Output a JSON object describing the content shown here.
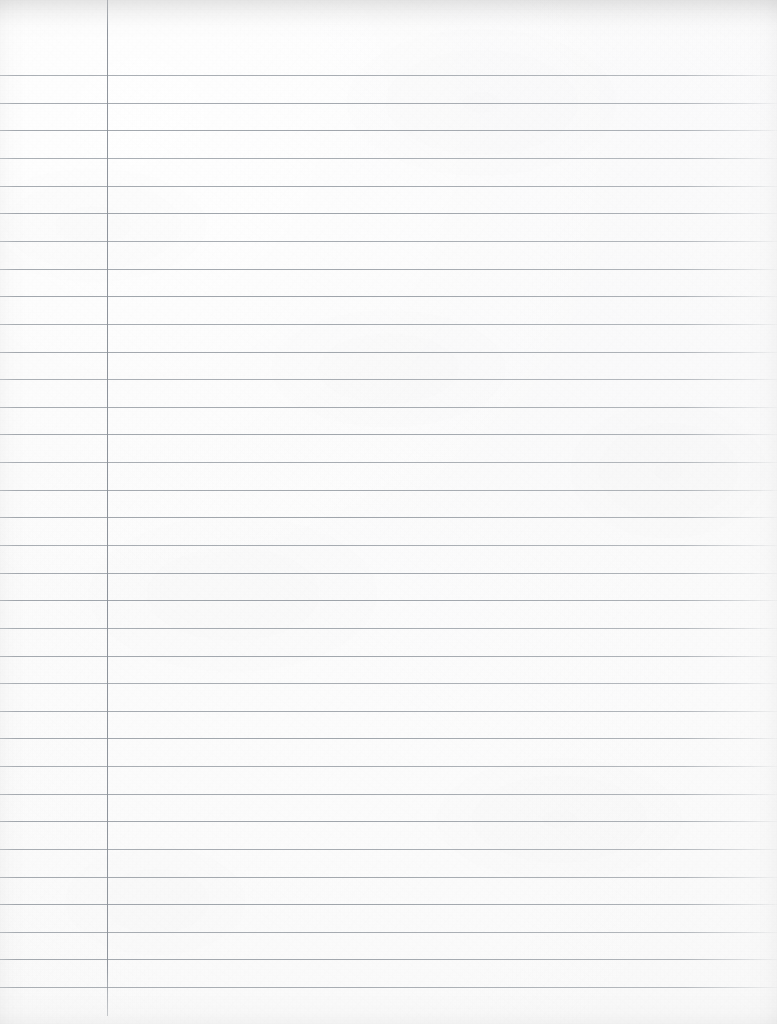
{
  "document": {
    "kind": "lined-notebook-paper",
    "title": "Blank ruled notebook page",
    "page_width": 777,
    "page_height": 1024,
    "content_text": "",
    "has_handwriting": false,
    "orientation": "portrait"
  },
  "colors": {
    "paper": "#fafafa",
    "paper_highlight": "#fcfcfc",
    "paper_shadow": "#f4f4f4",
    "rule_line": "#969ca3",
    "margin_line": "#8a9098",
    "edge_shadow": "#000000"
  },
  "ruling": {
    "style": "wide-ruled",
    "first_rule_y": 75,
    "rule_spacing": 27.6,
    "rule_count": 34,
    "rule_thickness": 1,
    "rule_left_x": 0,
    "rule_right_x": 777,
    "rule_positions": [
      75,
      103,
      130,
      158,
      186,
      213,
      241,
      269,
      296,
      324,
      352,
      379,
      407,
      434,
      462,
      490,
      517,
      545,
      573,
      600,
      628,
      656,
      683,
      711,
      738,
      766,
      794,
      821,
      849,
      877,
      904,
      932,
      959,
      987
    ]
  },
  "margin_rule": {
    "label": "left-margin-line",
    "x": 107,
    "top_y": 0,
    "bottom_y": 1016,
    "thickness": 1,
    "orientation": "vertical"
  },
  "regions": {
    "left_margin_label": "left margin (narrow column left of the vertical rule)",
    "writing_area_label": "main writing area (right of the vertical rule)",
    "header_label": "unruled header band above the first horizontal rule",
    "footer_label": "unruled footer band below the last horizontal rule"
  },
  "texture": {
    "description": "flatbed-scanned paper with fine grain, soft blotches, and darker shading along the page edges",
    "grain_opacity": 0.5,
    "blotch_opacity": 0.55,
    "vignette": true
  }
}
